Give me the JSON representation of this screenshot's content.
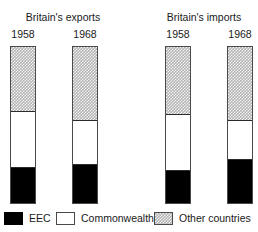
{
  "groups": [
    {
      "title": "Britain's exports",
      "years": [
        "1958",
        "1968"
      ]
    },
    {
      "title": "Britain's imports",
      "years": [
        "1958",
        "1968"
      ]
    }
  ],
  "legend": {
    "items": [
      {
        "label": "EEC",
        "color": "#000000",
        "swatch": "solid-black-swatch"
      },
      {
        "label": "Commonwealth",
        "color": "#ffffff",
        "swatch": "outlined-white-swatch"
      },
      {
        "label": "Other countries",
        "color": "#b4b4b4",
        "swatch": "stippled-grey-swatch"
      }
    ]
  },
  "chart_data": {
    "type": "bar",
    "title": "",
    "subtype": "100% stacked column",
    "xlabel": "",
    "ylabel": "",
    "ylim": [
      0,
      100
    ],
    "grid": false,
    "legend_position": "bottom",
    "categories": [
      "Britain's exports 1958",
      "Britain's exports 1968",
      "Britain's imports 1958",
      "Britain's imports 1968"
    ],
    "series": [
      {
        "name": "EEC",
        "color": "#000000",
        "values": [
          23,
          25,
          21,
          28
        ]
      },
      {
        "name": "Commonwealth",
        "color": "#ffffff",
        "values": [
          36,
          28,
          36,
          25
        ]
      },
      {
        "name": "Other countries",
        "color": "#b4b4b4",
        "values": [
          41,
          47,
          43,
          47
        ]
      }
    ],
    "bars": [
      {
        "group": "Britain's exports",
        "year": "1958",
        "segments": [
          {
            "name": "Other countries",
            "percent": 41
          },
          {
            "name": "Commonwealth",
            "percent": 36
          },
          {
            "name": "EEC",
            "percent": 23
          }
        ]
      },
      {
        "group": "Britain's exports",
        "year": "1968",
        "segments": [
          {
            "name": "Other countries",
            "percent": 47
          },
          {
            "name": "Commonwealth",
            "percent": 28
          },
          {
            "name": "EEC",
            "percent": 25
          }
        ]
      },
      {
        "group": "Britain's imports",
        "year": "1958",
        "segments": [
          {
            "name": "Other countries",
            "percent": 43
          },
          {
            "name": "Commonwealth",
            "percent": 36
          },
          {
            "name": "EEC",
            "percent": 21
          }
        ]
      },
      {
        "group": "Britain's imports",
        "year": "1968",
        "segments": [
          {
            "name": "Other countries",
            "percent": 47
          },
          {
            "name": "Commonwealth",
            "percent": 25
          },
          {
            "name": "EEC",
            "percent": 28
          }
        ]
      }
    ]
  }
}
